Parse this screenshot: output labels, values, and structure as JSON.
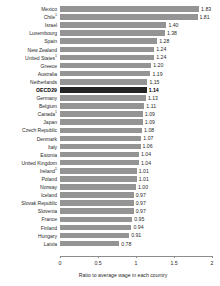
{
  "chart_data": {
    "type": "bar",
    "orientation": "horizontal",
    "title": "",
    "xlabel": "Ratio to average wage in each country",
    "ylabel": "",
    "xlim": [
      0,
      2
    ],
    "xticks": [
      "0",
      "0.5",
      "1",
      "1.5",
      "2"
    ],
    "xtick_values": [
      0,
      0.5,
      1,
      1.5,
      2
    ],
    "grid": false,
    "legend": null,
    "highlight_category": "OECD29",
    "colors": {
      "bar": "#949494",
      "highlight_bar": "#242424",
      "axis": "#8c8c8c",
      "text": "#2b2b2b",
      "background": "#ffffff"
    },
    "categories": [
      "Mexico",
      "Chile¹",
      "Israel",
      "Luxembourg",
      "Spain",
      "New Zealand",
      "United States¹",
      "Greece",
      "Australia",
      "Netherlands",
      "OECD29",
      "Germany",
      "Belgium",
      "Canada¹",
      "Japan",
      "Czech Republic",
      "Denmark",
      "Italy",
      "Estonia",
      "United Kingdom",
      "Ireland¹",
      "Poland",
      "Norway",
      "Iceland",
      "Slovak Republic",
      "Slovenia",
      "France",
      "Finland",
      "Hungary",
      "Latvia"
    ],
    "values": [
      1.83,
      1.81,
      1.4,
      1.38,
      1.28,
      1.24,
      1.24,
      1.2,
      1.19,
      1.15,
      1.14,
      1.13,
      1.11,
      1.09,
      1.09,
      1.08,
      1.07,
      1.06,
      1.04,
      1.04,
      1.01,
      1.01,
      1.0,
      0.97,
      0.97,
      0.97,
      0.95,
      0.94,
      0.91,
      0.78
    ],
    "value_labels": [
      "1.83",
      "1.81",
      "1.40",
      "1.38",
      "1.28",
      "1.24",
      "1.24",
      "1.20",
      "1.19",
      "1.15",
      "1.14",
      "1.13",
      "1.11",
      "1.09",
      "1.09",
      "1.08",
      "1.07",
      "1.06",
      "1.04",
      "1.04",
      "1.01",
      "1.01",
      "1.00",
      "0.97",
      "0.97",
      "0.97",
      "0.95",
      "0.94",
      "0.91",
      "0.78"
    ],
    "rows": [
      {
        "label": "Mexico",
        "footnote": "",
        "value": 1.83,
        "value_label": "1.83",
        "highlight": false
      },
      {
        "label": "Chile",
        "footnote": "1",
        "value": 1.81,
        "value_label": "1.81",
        "highlight": false
      },
      {
        "label": "Israel",
        "footnote": "",
        "value": 1.4,
        "value_label": "1.40",
        "highlight": false
      },
      {
        "label": "Luxembourg",
        "footnote": "",
        "value": 1.38,
        "value_label": "1.38",
        "highlight": false
      },
      {
        "label": "Spain",
        "footnote": "",
        "value": 1.28,
        "value_label": "1.28",
        "highlight": false
      },
      {
        "label": "New Zealand",
        "footnote": "",
        "value": 1.24,
        "value_label": "1.24",
        "highlight": false
      },
      {
        "label": "United States",
        "footnote": "1",
        "value": 1.24,
        "value_label": "1.24",
        "highlight": false
      },
      {
        "label": "Greece",
        "footnote": "",
        "value": 1.2,
        "value_label": "1.20",
        "highlight": false
      },
      {
        "label": "Australia",
        "footnote": "",
        "value": 1.19,
        "value_label": "1.19",
        "highlight": false
      },
      {
        "label": "Netherlands",
        "footnote": "",
        "value": 1.15,
        "value_label": "1.15",
        "highlight": false
      },
      {
        "label": "OECD29",
        "footnote": "",
        "value": 1.14,
        "value_label": "1.14",
        "highlight": true
      },
      {
        "label": "Germany",
        "footnote": "",
        "value": 1.13,
        "value_label": "1.13",
        "highlight": false
      },
      {
        "label": "Belgium",
        "footnote": "",
        "value": 1.11,
        "value_label": "1.11",
        "highlight": false
      },
      {
        "label": "Canada",
        "footnote": "1",
        "value": 1.09,
        "value_label": "1.09",
        "highlight": false
      },
      {
        "label": "Japan",
        "footnote": "",
        "value": 1.09,
        "value_label": "1.09",
        "highlight": false
      },
      {
        "label": "Czech Republic",
        "footnote": "",
        "value": 1.08,
        "value_label": "1.08",
        "highlight": false
      },
      {
        "label": "Denmark",
        "footnote": "",
        "value": 1.07,
        "value_label": "1.07",
        "highlight": false
      },
      {
        "label": "Italy",
        "footnote": "",
        "value": 1.06,
        "value_label": "1.06",
        "highlight": false
      },
      {
        "label": "Estonia",
        "footnote": "",
        "value": 1.04,
        "value_label": "1.04",
        "highlight": false
      },
      {
        "label": "United Kingdom",
        "footnote": "",
        "value": 1.04,
        "value_label": "1.04",
        "highlight": false
      },
      {
        "label": "Ireland",
        "footnote": "1",
        "value": 1.01,
        "value_label": "1.01",
        "highlight": false
      },
      {
        "label": "Poland",
        "footnote": "",
        "value": 1.01,
        "value_label": "1.01",
        "highlight": false
      },
      {
        "label": "Norway",
        "footnote": "",
        "value": 1.0,
        "value_label": "1.00",
        "highlight": false
      },
      {
        "label": "Iceland",
        "footnote": "",
        "value": 0.97,
        "value_label": "0.97",
        "highlight": false
      },
      {
        "label": "Slovak Republic",
        "footnote": "",
        "value": 0.97,
        "value_label": "0.97",
        "highlight": false
      },
      {
        "label": "Slovenia",
        "footnote": "",
        "value": 0.97,
        "value_label": "0.97",
        "highlight": false
      },
      {
        "label": "France",
        "footnote": "",
        "value": 0.95,
        "value_label": "0.95",
        "highlight": false
      },
      {
        "label": "Finland",
        "footnote": "",
        "value": 0.94,
        "value_label": "0.94",
        "highlight": false
      },
      {
        "label": "Hungary",
        "footnote": "",
        "value": 0.91,
        "value_label": "0.91",
        "highlight": false
      },
      {
        "label": "Latvia",
        "footnote": "",
        "value": 0.78,
        "value_label": "0.78",
        "highlight": false
      }
    ]
  }
}
